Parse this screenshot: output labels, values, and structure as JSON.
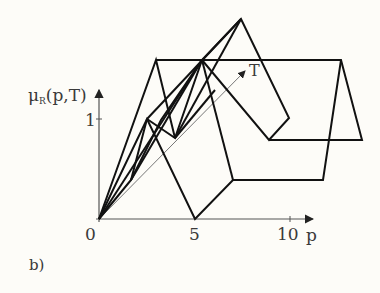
{
  "figure": {
    "panel_label": "b)",
    "y_axis": {
      "label_main": "μ",
      "label_sub": "R",
      "label_args": "(p,T)",
      "ticks": [
        {
          "value": 1,
          "label": "1"
        }
      ]
    },
    "x_axis": {
      "label": "p",
      "ticks": [
        {
          "value": 0,
          "label": "0"
        },
        {
          "value": 5,
          "label": "5"
        },
        {
          "value": 10,
          "label": "10"
        }
      ]
    },
    "depth_axis": {
      "label": "T"
    },
    "colors": {
      "background": "#fdfcf8",
      "line": "#111111",
      "axis": "#555555",
      "text": "#3a3a3a"
    }
  }
}
